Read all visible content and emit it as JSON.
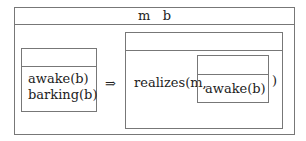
{
  "outer": {
    "title": "m   b"
  },
  "left_box": {
    "lines": [
      "awake(b)",
      "barking(b)"
    ]
  },
  "arrow": "⇒",
  "right_box": {
    "prefix": "realizes(m,",
    "suffix": ")",
    "nested_box": {
      "content": "awake(b)"
    }
  }
}
